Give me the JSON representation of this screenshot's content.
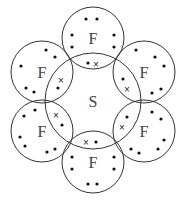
{
  "central_atom": {
    "symbol": "S",
    "cx": 93,
    "cy": 101,
    "r": 48
  },
  "outer_atoms": [
    {
      "id": "top",
      "symbol": "F",
      "cx": 93,
      "cy": 38,
      "r": 31,
      "dots": [
        [
          86,
          19
        ],
        [
          97,
          19
        ],
        [
          72,
          35
        ],
        [
          72,
          47
        ],
        [
          114,
          35
        ],
        [
          114,
          47
        ],
        [
          88,
          63
        ]
      ],
      "cross": [
        96,
        64
      ]
    },
    {
      "id": "upper-right",
      "symbol": "F",
      "cx": 144,
      "cy": 72,
      "r": 31,
      "dots": [
        [
          136,
          50
        ],
        [
          155,
          57
        ],
        [
          164,
          66
        ],
        [
          161,
          89
        ],
        [
          152,
          93
        ],
        [
          123,
          79
        ]
      ],
      "cross": [
        127,
        89
      ]
    },
    {
      "id": "lower-right",
      "symbol": "F",
      "cx": 144,
      "cy": 131,
      "r": 31,
      "dots": [
        [
          152,
          112
        ],
        [
          161,
          119
        ],
        [
          164,
          140
        ],
        [
          158,
          149
        ],
        [
          131,
          149
        ],
        [
          139,
          153
        ],
        [
          127,
          117
        ]
      ],
      "cross": [
        122,
        127
      ]
    },
    {
      "id": "bottom",
      "symbol": "F",
      "cx": 93,
      "cy": 162,
      "r": 31,
      "dots": [
        [
          96,
          142
        ],
        [
          72,
          157
        ],
        [
          72,
          169
        ],
        [
          114,
          157
        ],
        [
          114,
          169
        ],
        [
          88,
          184
        ],
        [
          97,
          184
        ]
      ],
      "cross": [
        86,
        142
      ]
    },
    {
      "id": "lower-left",
      "symbol": "F",
      "cx": 42,
      "cy": 131,
      "r": 31,
      "dots": [
        [
          35,
          110
        ],
        [
          24,
          116
        ],
        [
          20,
          137
        ],
        [
          25,
          146
        ],
        [
          47,
          152
        ],
        [
          55,
          149
        ],
        [
          62,
          125
        ]
      ],
      "cross": [
        56,
        115
      ]
    },
    {
      "id": "upper-left",
      "symbol": "F",
      "cx": 42,
      "cy": 72,
      "r": 31,
      "dots": [
        [
          46,
          50
        ],
        [
          55,
          57
        ],
        [
          21,
          66
        ],
        [
          26,
          88
        ],
        [
          34,
          92
        ],
        [
          58,
          88
        ]
      ],
      "cross": [
        61,
        80
      ]
    }
  ],
  "legend": {
    "dot": "F electron",
    "cross": "S electron"
  },
  "colors": {
    "stroke": "#333333",
    "text": "#444444",
    "background": "#ffffff"
  }
}
